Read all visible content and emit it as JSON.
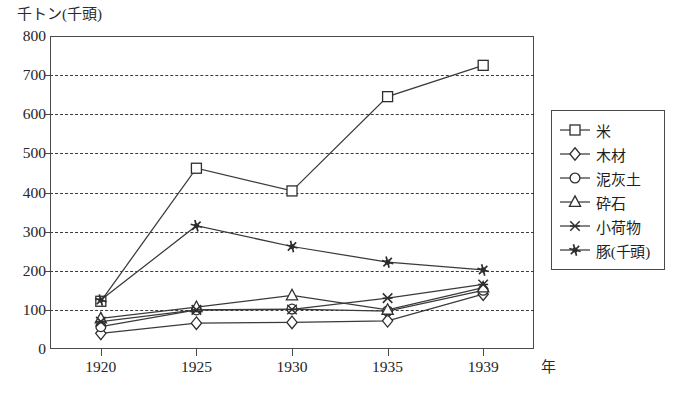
{
  "chart_data": {
    "type": "line",
    "title": "",
    "ylabel": "千トン(千頭)",
    "xlabel": "年",
    "x": [
      1920,
      1925,
      1930,
      1935,
      1939
    ],
    "xtick_labels": [
      "1920",
      "1925",
      "1930",
      "1935",
      "1939"
    ],
    "ytick_labels": [
      "0",
      "100",
      "200",
      "300",
      "400",
      "500",
      "600",
      "700",
      "800"
    ],
    "yticks": [
      0,
      100,
      200,
      300,
      400,
      500,
      600,
      700,
      800
    ],
    "ylim": [
      0,
      800
    ],
    "grid": "horizontal-dashed",
    "legend_position": "right",
    "series": [
      {
        "name": "米",
        "marker": "square",
        "values": [
          122,
          462,
          404,
          645,
          725
        ]
      },
      {
        "name": "木材",
        "marker": "diamond",
        "values": [
          40,
          66,
          68,
          72,
          140
        ]
      },
      {
        "name": "泥灰土",
        "marker": "circle",
        "values": [
          57,
          100,
          102,
          97,
          150
        ]
      },
      {
        "name": "砕石",
        "marker": "triangle",
        "values": [
          78,
          107,
          137,
          100,
          157
        ]
      },
      {
        "name": "小荷物",
        "marker": "cross",
        "values": [
          70,
          100,
          101,
          130,
          165
        ]
      },
      {
        "name": "豚(千頭)",
        "marker": "star",
        "values": [
          125,
          315,
          262,
          222,
          202
        ]
      }
    ],
    "colors": {
      "line": "#3a3a3a",
      "marker_fill": "#ffffff",
      "marker_stroke": "#2e2e2e",
      "grid": "#3b3b3b",
      "axis": "#4a4a4a",
      "background": "#ffffff"
    }
  }
}
